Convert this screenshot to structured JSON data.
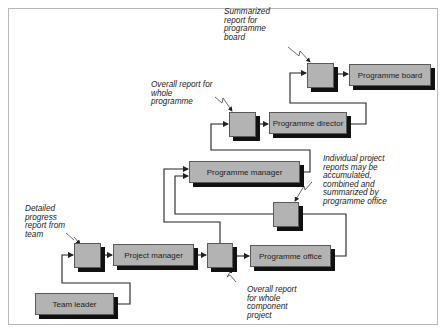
{
  "diagram": {
    "nodes": {
      "programme_board": "Programme board",
      "programme_director": "Programme director",
      "programme_manager": "Programme manager",
      "project_manager": "Project manager",
      "programme_office": "Programme office",
      "team_leader": "Team leader"
    },
    "report_points": [
      {
        "id": "board-summary",
        "label": "Summarized\nreport for\nprogramme\nboard"
      },
      {
        "id": "whole-programme",
        "label": "Overall report for\nwhole\nprogramme"
      },
      {
        "id": "office-accumulated",
        "label": "Individual project\nreports may be\naccumulated,\ncombined and\nsummarized by\nprogramme office"
      },
      {
        "id": "team-progress",
        "label": "Detailed\nprogress\nreport from\nteam"
      },
      {
        "id": "component-project",
        "label": "Overall  report\nfor whole\ncomponent\nproject"
      }
    ],
    "colors": {
      "box_fill": "#b3b3b3",
      "box_border": "#5a5a5a",
      "shadow": "#111111",
      "line": "#222222",
      "frame": "#b8b8b8"
    }
  }
}
